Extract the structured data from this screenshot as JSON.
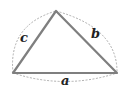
{
  "diagram": {
    "type": "triangle-with-arcs",
    "vertices": {
      "left": [
        13,
        73
      ],
      "top": [
        56,
        11
      ],
      "right": [
        117,
        73
      ]
    },
    "sides": [
      {
        "name": "a",
        "label": "a",
        "between": [
          "left",
          "right"
        ]
      },
      {
        "name": "b",
        "label": "b",
        "between": [
          "top",
          "right"
        ]
      },
      {
        "name": "c",
        "label": "c",
        "between": [
          "left",
          "top"
        ]
      }
    ],
    "colors": {
      "triangle_stroke": "#808080",
      "arc_stroke": "#999999",
      "label": "#222222"
    }
  }
}
